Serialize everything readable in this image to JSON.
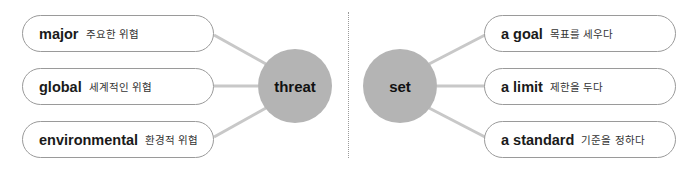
{
  "left_group": {
    "hub": "threat",
    "items": [
      {
        "en": "major",
        "ko": "주요한 위협"
      },
      {
        "en": "global",
        "ko": "세계적인 위협"
      },
      {
        "en": "environmental",
        "ko": "환경적 위협"
      }
    ]
  },
  "right_group": {
    "hub": "set",
    "items": [
      {
        "en": "a goal",
        "ko": "목표를 세우다"
      },
      {
        "en": "a limit",
        "ko": "제한을 두다"
      },
      {
        "en": "a standard",
        "ko": "기준을 정하다"
      }
    ]
  },
  "colors": {
    "hub_fill": "#b4b4b4",
    "connector": "#c8c8c8",
    "pill_border": "#9a9a9a"
  }
}
